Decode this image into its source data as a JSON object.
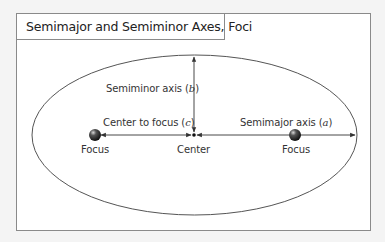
{
  "title": "Semimajor and Semiminor Axes, Foci",
  "labels": {
    "semiminor_axis": "Semiminor axis",
    "semiminor_symbol": "b",
    "center_to_focus": "Center to focus",
    "center_to_focus_symbol": "c",
    "semimajor_axis": "Semimajor axis",
    "semimajor_symbol": "a",
    "focus_left": "Focus",
    "center": "Center",
    "focus_right": "Focus"
  },
  "colors": {
    "frame": "#8a8a8a",
    "ellipse": "#555555",
    "lines": "#333333",
    "focus_sphere": "#2a2a2a",
    "background": "#f4f4f4"
  }
}
